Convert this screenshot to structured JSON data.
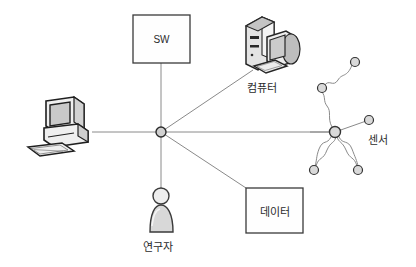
{
  "diagram": {
    "title": "",
    "colors": {
      "background": "#ffffff",
      "edge": "#8a8a8a",
      "node_fill": "#d9d9d9",
      "node_stroke": "#333333",
      "box_stroke": "#3a3a3a",
      "box_fill": "#fefefe",
      "text": "#2b2b2b",
      "icon_dark": "#2a2a2a",
      "icon_light": "#e8e8e8",
      "icon_mid": "#b5b5b5"
    },
    "boxes": [
      {
        "id": "sw",
        "label": "SW",
        "x": 133,
        "y": 15,
        "w": 57,
        "h": 48
      },
      {
        "id": "data",
        "label": "데이터",
        "x": 246,
        "y": 188,
        "w": 57,
        "h": 45
      }
    ],
    "icons": [
      {
        "id": "workstation",
        "name": "desktop-workstation-icon",
        "label": "",
        "x": 30,
        "y": 97
      },
      {
        "id": "computer",
        "name": "tower-computer-icon",
        "label": "컴퓨터",
        "x": 243,
        "y": 14
      },
      {
        "id": "researcher",
        "name": "person-icon",
        "label": "연구자",
        "x": 148,
        "y": 186
      }
    ],
    "labels": {
      "sw": "SW",
      "data": "데이터",
      "computer": "컴퓨터",
      "sensor": "센서",
      "researcher": "연구자"
    },
    "hub": {
      "id": "center-hub",
      "x": 161,
      "y": 132,
      "r": 5
    },
    "sensor_hub": {
      "id": "sensor-hub",
      "x": 335,
      "y": 132,
      "r": 5.5
    },
    "sensor_nodes": [
      {
        "id": "sensor-node-top-right",
        "x": 355,
        "y": 62,
        "r": 4.5
      },
      {
        "id": "sensor-node-upper-left",
        "x": 322,
        "y": 88,
        "r": 4.5
      },
      {
        "id": "sensor-node-right",
        "x": 369,
        "y": 120,
        "r": 4.5
      },
      {
        "id": "sensor-node-bottom-left",
        "x": 314,
        "y": 170,
        "r": 4.5
      },
      {
        "id": "sensor-node-bottom-right",
        "x": 358,
        "y": 170,
        "r": 4.5
      }
    ],
    "edges": [
      {
        "id": "edge-workstation-hub",
        "from": "workstation",
        "to": "center-hub"
      },
      {
        "id": "edge-sw-hub",
        "from": "sw",
        "to": "center-hub"
      },
      {
        "id": "edge-computer-hub",
        "from": "computer",
        "to": "center-hub"
      },
      {
        "id": "edge-researcher-hub",
        "from": "researcher",
        "to": "center-hub"
      },
      {
        "id": "edge-data-hub",
        "from": "data",
        "to": "center-hub"
      },
      {
        "id": "edge-hub-sensorhub",
        "from": "center-hub",
        "to": "sensor-hub"
      }
    ]
  }
}
